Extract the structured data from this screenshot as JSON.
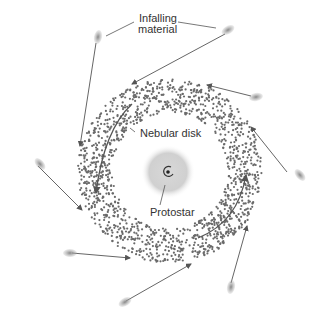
{
  "diagram": {
    "labels": {
      "infalling": [
        "Infalling",
        "material"
      ],
      "disk": "Nebular disk",
      "protostar": "Protostar"
    },
    "colors": {
      "dots": "#6a6a6a",
      "arrow": "#555555",
      "glow": "#bdbdbd"
    }
  }
}
